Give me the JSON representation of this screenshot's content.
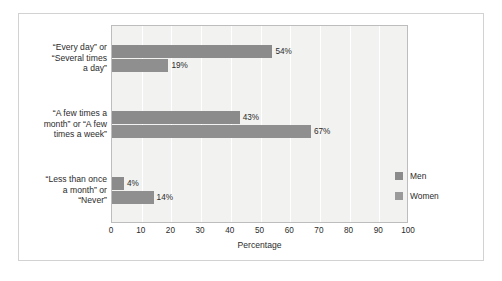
{
  "chart_data": {
    "type": "bar",
    "orientation": "horizontal",
    "title": "",
    "xlabel": "Percentage",
    "ylabel": "",
    "xlim": [
      0,
      100
    ],
    "xticks": [
      0,
      10,
      20,
      30,
      40,
      50,
      60,
      70,
      80,
      90,
      100
    ],
    "xtick_labels": [
      "0",
      "10",
      "20",
      "30",
      "40",
      "50",
      "60",
      "70",
      "80",
      "90",
      "100"
    ],
    "grid": "vertical",
    "legend_position": "inside-right",
    "categories": [
      "“Every day” or “Several times a day”",
      "“A few times a month” or “A few times a week”",
      "“Less than once a month” or “Never”"
    ],
    "category_lines": [
      [
        "“Every day” or",
        "“Several times",
        "a day”"
      ],
      [
        "“A few times a",
        "month” or “A few",
        "times a week”"
      ],
      [
        "“Less than once",
        "a month” or",
        "“Never”"
      ]
    ],
    "series": [
      {
        "name": "Men",
        "color": "#8b8b8b",
        "values": [
          54,
          43,
          4
        ],
        "labels": [
          "54%",
          "43%",
          "4%"
        ]
      },
      {
        "name": "Women",
        "color": "#8f8f8f",
        "values": [
          19,
          67,
          14
        ],
        "labels": [
          "19%",
          "67%",
          "14%"
        ]
      }
    ]
  },
  "legend": {
    "items": [
      {
        "label": "Men",
        "color": "#8b8b8b"
      },
      {
        "label": "Women",
        "color": "#9a9a9a"
      }
    ]
  },
  "axis": {
    "x_title": "Percentage"
  },
  "colors": {
    "plot_background": "#f2f2f0",
    "gridline": "#ffffff",
    "plot_border": "#bdbdbd",
    "figure_border": "#d2d2d2",
    "text": "#2b2b2b",
    "bar_men": "#8b8b8b",
    "bar_women": "#8f8f8f"
  }
}
